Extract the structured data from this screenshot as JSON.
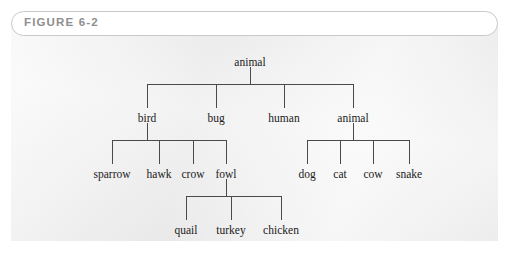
{
  "figure": {
    "label": "FIGURE 6-2",
    "panel_color": "#eeeeee",
    "label_color": "#8e8e8e",
    "border_color": "#c9c9c9",
    "line_color": "#4a4a4a",
    "text_color": "#1a1a1a"
  },
  "chart_data": {
    "type": "diagram",
    "diagram_kind": "tree",
    "title": "FIGURE 6-2",
    "orientation": "top-down",
    "nodes": [
      {
        "id": "root",
        "label": "animal",
        "level": 0,
        "x": 250,
        "y": 62
      },
      {
        "id": "bird",
        "label": "bird",
        "level": 1,
        "x": 147,
        "y": 118
      },
      {
        "id": "bug",
        "label": "bug",
        "level": 1,
        "x": 216,
        "y": 118
      },
      {
        "id": "human",
        "label": "human",
        "level": 1,
        "x": 284,
        "y": 118
      },
      {
        "id": "animal2",
        "label": "animal",
        "level": 1,
        "x": 353,
        "y": 118
      },
      {
        "id": "sparrow",
        "label": "sparrow",
        "level": 2,
        "x": 112,
        "y": 174
      },
      {
        "id": "hawk",
        "label": "hawk",
        "level": 2,
        "x": 159,
        "y": 174
      },
      {
        "id": "crow",
        "label": "crow",
        "level": 2,
        "x": 193,
        "y": 174
      },
      {
        "id": "fowl",
        "label": "fowl",
        "level": 2,
        "x": 226,
        "y": 174
      },
      {
        "id": "dog",
        "label": "dog",
        "level": 2,
        "x": 307,
        "y": 174
      },
      {
        "id": "cat",
        "label": "cat",
        "level": 2,
        "x": 340,
        "y": 174
      },
      {
        "id": "cow",
        "label": "cow",
        "level": 2,
        "x": 373,
        "y": 174
      },
      {
        "id": "snake",
        "label": "snake",
        "level": 2,
        "x": 409,
        "y": 174
      },
      {
        "id": "quail",
        "label": "quail",
        "level": 3,
        "x": 186,
        "y": 230
      },
      {
        "id": "turkey",
        "label": "turkey",
        "level": 3,
        "x": 231,
        "y": 230
      },
      {
        "id": "chicken",
        "label": "chicken",
        "level": 3,
        "x": 281,
        "y": 230
      }
    ],
    "edges": [
      {
        "from": "root",
        "to": "bird"
      },
      {
        "from": "root",
        "to": "bug"
      },
      {
        "from": "root",
        "to": "human"
      },
      {
        "from": "root",
        "to": "animal2"
      },
      {
        "from": "bird",
        "to": "sparrow"
      },
      {
        "from": "bird",
        "to": "hawk"
      },
      {
        "from": "bird",
        "to": "crow"
      },
      {
        "from": "bird",
        "to": "fowl"
      },
      {
        "from": "animal2",
        "to": "dog"
      },
      {
        "from": "animal2",
        "to": "cat"
      },
      {
        "from": "animal2",
        "to": "cow"
      },
      {
        "from": "animal2",
        "to": "snake"
      },
      {
        "from": "fowl",
        "to": "quail"
      },
      {
        "from": "fowl",
        "to": "turkey"
      },
      {
        "from": "fowl",
        "to": "chicken"
      }
    ]
  }
}
